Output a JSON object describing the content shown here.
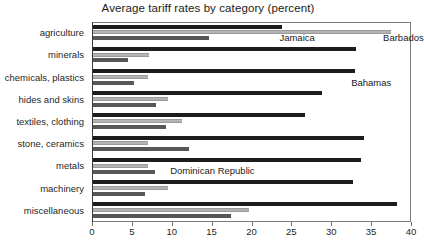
{
  "chart_data": {
    "type": "bar",
    "orientation": "horizontal",
    "title": "Average tariff rates by category (percent)",
    "xlabel": "",
    "ylabel": "",
    "xlim": [
      0,
      40
    ],
    "xticks": [
      0,
      5,
      10,
      15,
      20,
      25,
      30,
      35,
      40
    ],
    "grid": false,
    "legend_position": "inline-annotations",
    "categories": [
      "agriculture",
      "minerals",
      "chemicals, plastics",
      "hides and skins",
      "textiles, clothing",
      "stone, ceramics",
      "metals",
      "machinery",
      "miscellaneous"
    ],
    "series": [
      {
        "name": "Jamaica",
        "color": "#1c1c1c",
        "values": [
          23.7,
          33.0,
          32.8,
          28.7,
          26.6,
          34.0,
          33.6,
          32.6,
          38.1
        ]
      },
      {
        "name": "Barbados",
        "color": "#b4b4b4",
        "values": [
          37.4,
          7.0,
          6.9,
          9.4,
          11.2,
          6.9,
          6.9,
          9.4,
          19.6
        ]
      },
      {
        "name": "Bahamas",
        "color": "#575757",
        "values": [
          14.5,
          4.4,
          5.1,
          7.9,
          9.2,
          12.0,
          7.8,
          6.5,
          17.3
        ]
      }
    ],
    "annotations": [
      {
        "text": "Jamaica",
        "x_value": 23.5,
        "row": 0
      },
      {
        "text": "Barbados",
        "x_value": 36.5,
        "row": 0
      },
      {
        "text": "Bahamas",
        "x_value": 32.5,
        "row": 2
      },
      {
        "text": "Dominican Republic",
        "x_value": 9.8,
        "row": 6
      }
    ]
  }
}
